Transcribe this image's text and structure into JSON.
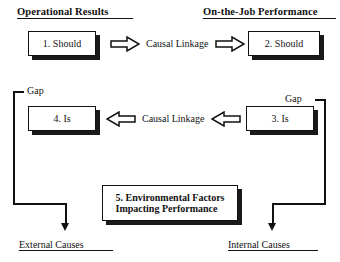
{
  "diagram": {
    "headings": [
      {
        "id": "operational-results",
        "text": "Operational Results"
      },
      {
        "id": "on-the-job-performance",
        "text": "On-the-Job Performance"
      }
    ],
    "boxes": [
      {
        "id": "box-1",
        "text": "1.  Should"
      },
      {
        "id": "box-2",
        "text": "2.  Should"
      },
      {
        "id": "box-4",
        "text": "4.  Is"
      },
      {
        "id": "box-3",
        "text": "3.  Is"
      },
      {
        "id": "box-5",
        "line1": "5.  Environmental Factors",
        "line2": "Impacting Performance",
        "text": "5.  Environmental Factors\nImpacting Performance"
      }
    ],
    "linkage_labels": [
      {
        "id": "causal-linkage-top",
        "text": "Causal Linkage"
      },
      {
        "id": "causal-linkage-middle",
        "text": "Causal Linkage"
      }
    ],
    "gap_labels": [
      {
        "id": "gap-left",
        "text": "Gap"
      },
      {
        "id": "gap-right",
        "text": "Gap"
      }
    ],
    "outcome_labels": [
      {
        "id": "external-causes",
        "text": "External Causes"
      },
      {
        "id": "internal-causes",
        "text": "Internal Causes"
      }
    ],
    "arrows": [
      {
        "id": "arrow-top-left",
        "direction": "right"
      },
      {
        "id": "arrow-top-right",
        "direction": "right"
      },
      {
        "id": "arrow-middle-left",
        "direction": "left"
      },
      {
        "id": "arrow-middle-right",
        "direction": "left"
      }
    ],
    "colors": {
      "ink": "#111111",
      "paper": "#ffffff",
      "shadow": "#1a1a1a"
    }
  }
}
